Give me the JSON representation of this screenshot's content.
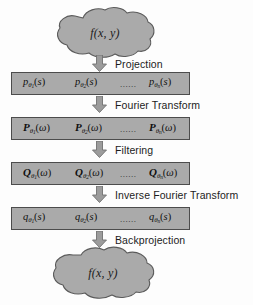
{
  "diagram": {
    "colors": {
      "box_fill": "#aaaaaa",
      "box_stroke": "#4c4c4c",
      "cloud_fill": "#aaaaaa",
      "cloud_stroke": "#5a5a5a",
      "arrow_fill": "#9c9c9c",
      "arrow_stroke": "#6a6a6a",
      "text": "#101010",
      "background": "#fdfdfd"
    },
    "nodes": {
      "input_cloud": {
        "label": "f(x, y)",
        "shape": "cloud"
      },
      "output_cloud": {
        "label": "f(x, y)",
        "shape": "cloud"
      }
    },
    "steps": [
      {
        "id": "projection",
        "label": "Projection"
      },
      {
        "id": "fourier-transform",
        "label": "Fourier Transform"
      },
      {
        "id": "filtering",
        "label": "Filtering"
      },
      {
        "id": "inverse-fourier-transform",
        "label": "Inverse Fourier Transform"
      },
      {
        "id": "backprojection",
        "label": "Backprojection"
      }
    ],
    "boxes": [
      {
        "id": "projections",
        "symbol": "p",
        "script": false,
        "argument": "s",
        "terms": [
          {
            "base": "p",
            "sub": "1",
            "arg": "s"
          },
          {
            "base": "p",
            "sub": "2",
            "arg": "s"
          },
          {
            "base": "p",
            "sub": "n",
            "arg": "s"
          }
        ],
        "ellipsis": "......"
      },
      {
        "id": "fourier-transforms",
        "symbol": "P",
        "script": true,
        "argument": "ω",
        "terms": [
          {
            "base": "P",
            "sub": "1",
            "arg": "ω"
          },
          {
            "base": "P",
            "sub": "2",
            "arg": "ω"
          },
          {
            "base": "P",
            "sub": "n",
            "arg": "ω"
          }
        ],
        "ellipsis": "......"
      },
      {
        "id": "filtered-spectra",
        "symbol": "Q",
        "script": true,
        "argument": "ω",
        "terms": [
          {
            "base": "Q",
            "sub": "1",
            "arg": "ω"
          },
          {
            "base": "Q",
            "sub": "2",
            "arg": "ω"
          },
          {
            "base": "Q",
            "sub": "n",
            "arg": "ω"
          }
        ],
        "ellipsis": "......"
      },
      {
        "id": "filtered-projections",
        "symbol": "q",
        "script": false,
        "argument": "s",
        "terms": [
          {
            "base": "q",
            "sub": "1",
            "arg": "s"
          },
          {
            "base": "q",
            "sub": "2",
            "arg": "s"
          },
          {
            "base": "q",
            "sub": "n",
            "arg": "s"
          }
        ],
        "ellipsis": "......"
      }
    ],
    "symbols": {
      "theta": "θ",
      "omega": "ω"
    }
  }
}
